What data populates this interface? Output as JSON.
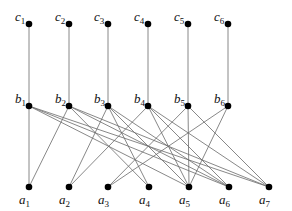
{
  "diagram": {
    "type": "layered-graph",
    "node_color": "#000000",
    "edge_color": "#6a6a6a",
    "layers": [
      {
        "name": "c",
        "nodes": [
          {
            "id": "c1",
            "letter": "c",
            "sub": "1",
            "x": 29,
            "y": 24
          },
          {
            "id": "c2",
            "letter": "c",
            "sub": "2",
            "x": 69,
            "y": 24
          },
          {
            "id": "c3",
            "letter": "c",
            "sub": "3",
            "x": 108,
            "y": 24
          },
          {
            "id": "c4",
            "letter": "c",
            "sub": "4",
            "x": 148,
            "y": 24
          },
          {
            "id": "c5",
            "letter": "c",
            "sub": "5",
            "x": 188,
            "y": 24
          },
          {
            "id": "c6",
            "letter": "c",
            "sub": "6",
            "x": 228,
            "y": 24
          }
        ]
      },
      {
        "name": "b",
        "nodes": [
          {
            "id": "b1",
            "letter": "b",
            "sub": "1",
            "x": 29,
            "y": 106
          },
          {
            "id": "b2",
            "letter": "b",
            "sub": "2",
            "x": 69,
            "y": 106
          },
          {
            "id": "b3",
            "letter": "b",
            "sub": "3",
            "x": 108,
            "y": 106
          },
          {
            "id": "b4",
            "letter": "b",
            "sub": "4",
            "x": 148,
            "y": 106
          },
          {
            "id": "b5",
            "letter": "b",
            "sub": "5",
            "x": 188,
            "y": 106
          },
          {
            "id": "b6",
            "letter": "b",
            "sub": "6",
            "x": 228,
            "y": 106
          }
        ]
      },
      {
        "name": "a",
        "nodes": [
          {
            "id": "a1",
            "letter": "a",
            "sub": "1",
            "x": 29,
            "y": 187
          },
          {
            "id": "a2",
            "letter": "a",
            "sub": "2",
            "x": 69,
            "y": 187
          },
          {
            "id": "a3",
            "letter": "a",
            "sub": "3",
            "x": 108,
            "y": 187
          },
          {
            "id": "a4",
            "letter": "a",
            "sub": "4",
            "x": 149,
            "y": 187
          },
          {
            "id": "a5",
            "letter": "a",
            "sub": "5",
            "x": 189,
            "y": 187
          },
          {
            "id": "a6",
            "letter": "a",
            "sub": "6",
            "x": 229,
            "y": 187
          },
          {
            "id": "a7",
            "letter": "a",
            "sub": "7",
            "x": 269,
            "y": 187
          }
        ]
      }
    ],
    "edges": [
      [
        "c1",
        "b1"
      ],
      [
        "c2",
        "b2"
      ],
      [
        "c3",
        "b3"
      ],
      [
        "c4",
        "b4"
      ],
      [
        "c5",
        "b5"
      ],
      [
        "c6",
        "b6"
      ],
      [
        "b1",
        "a1"
      ],
      [
        "b1",
        "a5"
      ],
      [
        "b1",
        "a6"
      ],
      [
        "b1",
        "a7"
      ],
      [
        "b2",
        "a1"
      ],
      [
        "b2",
        "a4"
      ],
      [
        "b2",
        "a6"
      ],
      [
        "b2",
        "a7"
      ],
      [
        "b3",
        "a2"
      ],
      [
        "b3",
        "a4"
      ],
      [
        "b3",
        "a5"
      ],
      [
        "b3",
        "a6"
      ],
      [
        "b4",
        "a2"
      ],
      [
        "b4",
        "a5"
      ],
      [
        "b4",
        "a6"
      ],
      [
        "b4",
        "a7"
      ],
      [
        "b5",
        "a3"
      ],
      [
        "b5",
        "a5"
      ],
      [
        "b5",
        "a7"
      ],
      [
        "b6",
        "a3"
      ],
      [
        "b6",
        "a5"
      ]
    ]
  }
}
